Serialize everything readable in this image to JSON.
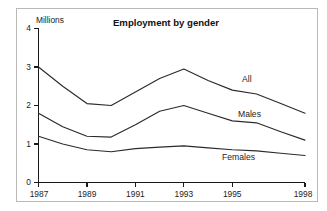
{
  "figure": {
    "background_color": "#ffffff",
    "border_color": "#b9b9b9",
    "line_color": "#2b2b2b",
    "axis_color": "#1a1a1a"
  },
  "axis_title_y": "Millions",
  "series_labels": {
    "all": "All",
    "males": "Males",
    "females": "Females"
  },
  "y_ticks": [
    "0",
    "1",
    "2",
    "3",
    "4"
  ],
  "x_ticks": [
    "1987",
    "1989",
    "1991",
    "1993",
    "1995",
    "1998"
  ],
  "chart_data": {
    "type": "line",
    "title": "Employment by gender",
    "subtitle": "",
    "xlabel": "",
    "ylabel": "Millions",
    "xlim": [
      1987,
      1998
    ],
    "ylim": [
      0,
      4
    ],
    "grid": false,
    "legend_position": "inline-right",
    "x": [
      1987,
      1988,
      1989,
      1990,
      1991,
      1992,
      1993,
      1994,
      1995,
      1996,
      1997,
      1998
    ],
    "x_tick_values": [
      1987,
      1989,
      1991,
      1993,
      1995,
      1998
    ],
    "y_tick_values": [
      0,
      1,
      2,
      3,
      4
    ],
    "series": [
      {
        "name": "All",
        "values": [
          3.0,
          2.5,
          2.05,
          2.0,
          2.35,
          2.7,
          2.95,
          2.65,
          2.4,
          2.3,
          2.05,
          1.8
        ]
      },
      {
        "name": "Males",
        "values": [
          1.8,
          1.45,
          1.2,
          1.18,
          1.5,
          1.85,
          2.0,
          1.8,
          1.6,
          1.55,
          1.32,
          1.1
        ]
      },
      {
        "name": "Females",
        "values": [
          1.2,
          1.0,
          0.85,
          0.8,
          0.88,
          0.92,
          0.95,
          0.9,
          0.85,
          0.82,
          0.76,
          0.7
        ]
      }
    ],
    "annotations": [
      {
        "text": "All",
        "series": "All"
      },
      {
        "text": "Males",
        "series": "Males"
      },
      {
        "text": "Females",
        "series": "Females"
      }
    ]
  }
}
